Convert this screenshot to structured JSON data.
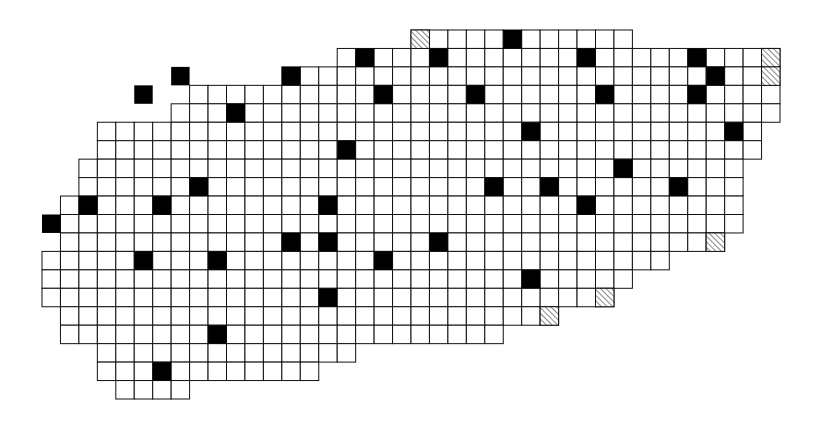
{
  "diagram": {
    "title": "",
    "cell_size": 18.45,
    "origin": [
      42,
      30
    ],
    "colors": {
      "line": "#111111",
      "fill": "#000000",
      "hatch": "#555555",
      "background": "#ffffff"
    },
    "rows": [
      [
        20,
        31
      ],
      [
        16,
        39
      ],
      [
        13,
        39
      ],
      [
        8,
        39
      ],
      [
        7,
        39
      ],
      [
        3,
        38
      ],
      [
        3,
        38
      ],
      [
        2,
        37
      ],
      [
        2,
        37
      ],
      [
        1,
        37
      ],
      [
        1,
        37
      ],
      [
        1,
        36
      ],
      [
        0,
        33
      ],
      [
        0,
        31
      ],
      [
        0,
        30
      ],
      [
        1,
        27
      ],
      [
        1,
        24
      ],
      [
        3,
        16
      ],
      [
        3,
        14
      ],
      [
        4,
        7
      ]
    ],
    "filled": [
      [
        0,
        25
      ],
      [
        1,
        17
      ],
      [
        1,
        21
      ],
      [
        1,
        29
      ],
      [
        1,
        35
      ],
      [
        2,
        7
      ],
      [
        2,
        13
      ],
      [
        2,
        36
      ],
      [
        3,
        5
      ],
      [
        3,
        18
      ],
      [
        3,
        23
      ],
      [
        3,
        30
      ],
      [
        3,
        35
      ],
      [
        4,
        10
      ],
      [
        5,
        26
      ],
      [
        5,
        37
      ],
      [
        6,
        16
      ],
      [
        7,
        31
      ],
      [
        8,
        8
      ],
      [
        8,
        24
      ],
      [
        8,
        27
      ],
      [
        8,
        34
      ],
      [
        9,
        2
      ],
      [
        9,
        6
      ],
      [
        9,
        15
      ],
      [
        9,
        29
      ],
      [
        10,
        0
      ],
      [
        11,
        13
      ],
      [
        11,
        21
      ],
      [
        11,
        15
      ],
      [
        12,
        5
      ],
      [
        12,
        9
      ],
      [
        12,
        18
      ],
      [
        13,
        26
      ],
      [
        14,
        15
      ],
      [
        16,
        9
      ],
      [
        18,
        6
      ]
    ],
    "hatched": [
      [
        0,
        20
      ],
      [
        1,
        39
      ],
      [
        2,
        39
      ],
      [
        11,
        36
      ],
      [
        14,
        30
      ],
      [
        15,
        27
      ]
    ]
  }
}
